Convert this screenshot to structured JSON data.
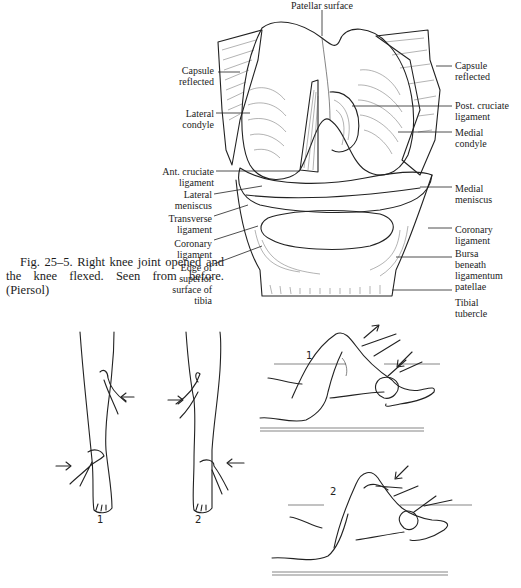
{
  "page": {
    "kind": "scanned textbook page"
  },
  "knee_figure": {
    "title": "Right knee joint opened (anatomical illustration)",
    "labels_top": [
      {
        "id": "patellar-surface",
        "text": [
          "Patellar surface"
        ]
      }
    ],
    "labels_left": [
      {
        "id": "capsule-reflected-left",
        "text": [
          "Capsule",
          "reflected"
        ]
      },
      {
        "id": "lateral-condyle",
        "text": [
          "Lateral",
          "condyle"
        ]
      },
      {
        "id": "ant-cruciate-ligament",
        "text": [
          "Ant. cruciate",
          "ligament"
        ]
      },
      {
        "id": "lateral-meniscus",
        "text": [
          "Lateral",
          "meniscus"
        ]
      },
      {
        "id": "transverse-ligament",
        "text": [
          "Transverse",
          "ligament"
        ]
      },
      {
        "id": "coronary-ligament-left",
        "text": [
          "Coronary",
          "ligament"
        ]
      },
      {
        "id": "edge-superior-surface-tibia",
        "text": [
          "Edge of",
          "superior",
          "surface of",
          "tibia"
        ]
      }
    ],
    "labels_right": [
      {
        "id": "capsule-reflected-right",
        "text": [
          "Capsule",
          "reflected"
        ]
      },
      {
        "id": "post-cruciate-ligament",
        "text": [
          "Post. cruciate",
          "ligament"
        ]
      },
      {
        "id": "medial-condyle",
        "text": [
          "Medial",
          "condyle"
        ]
      },
      {
        "id": "medial-meniscus",
        "text": [
          "Medial",
          "meniscus"
        ]
      },
      {
        "id": "coronary-ligament-right",
        "text": [
          "Coronary",
          "ligament"
        ]
      },
      {
        "id": "bursa-beneath-ligamentum-patellae",
        "text": [
          "Bursa",
          "beneath",
          "ligamentum",
          "patellae"
        ]
      },
      {
        "id": "tibial-tubercle",
        "text": [
          "Tibial",
          "tubercle"
        ]
      }
    ]
  },
  "caption": {
    "text": "Fig. 25–5. Right knee joint opened and the knee flexed. Seen from before. (Piersol)"
  },
  "lower_figures": {
    "standing_legs": [
      {
        "number": "1",
        "description": "front view of leg, hand pressure inward at knee (right) and ankle (left)"
      },
      {
        "number": "2",
        "description": "front view of leg, hand pressure at knee (left) and ankle (right)"
      }
    ],
    "supine_legs": [
      {
        "number": "1",
        "description": "knee flexed, examiner rotating foot, arrows indicating direction"
      },
      {
        "number": "2",
        "description": "knee flexed, examiner hand on knee, arrow pressing down"
      }
    ]
  },
  "bottom_caption": {
    "text": "",
    "note_visible": "clipped at image edge; unreadable"
  }
}
